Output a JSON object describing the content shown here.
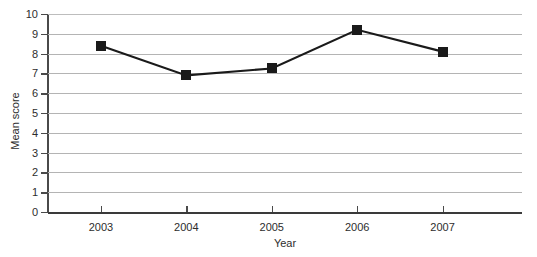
{
  "chart_data": {
    "type": "line",
    "title": "",
    "xlabel": "Year",
    "ylabel": "Mean score",
    "categories": [
      "2003",
      "2004",
      "2005",
      "2006",
      "2007"
    ],
    "values": [
      8.4,
      6.9,
      7.25,
      9.2,
      8.1
    ],
    "series": [
      {
        "name": "Mean score",
        "values": [
          8.4,
          6.9,
          7.25,
          9.2,
          8.1
        ],
        "marker": "filled-square",
        "color": "#1a1a1a"
      }
    ],
    "ylim": [
      0,
      10
    ],
    "yticks": [
      0,
      1,
      2,
      3,
      4,
      5,
      6,
      7,
      8,
      9,
      10
    ],
    "ytick_labels": [
      "0",
      "1",
      "2",
      "3",
      "4",
      "5",
      "6",
      "7",
      "8",
      "9",
      "10"
    ],
    "grid": true,
    "grid_axis": "y",
    "legend": false,
    "legend_position": "none",
    "colors": {
      "line": "#1a1a1a",
      "marker": "#1a1a1a",
      "grid": "#b4b4b4",
      "axis": "#4a4a4a",
      "text": "#2d2d2d",
      "background": "#ffffff"
    }
  }
}
